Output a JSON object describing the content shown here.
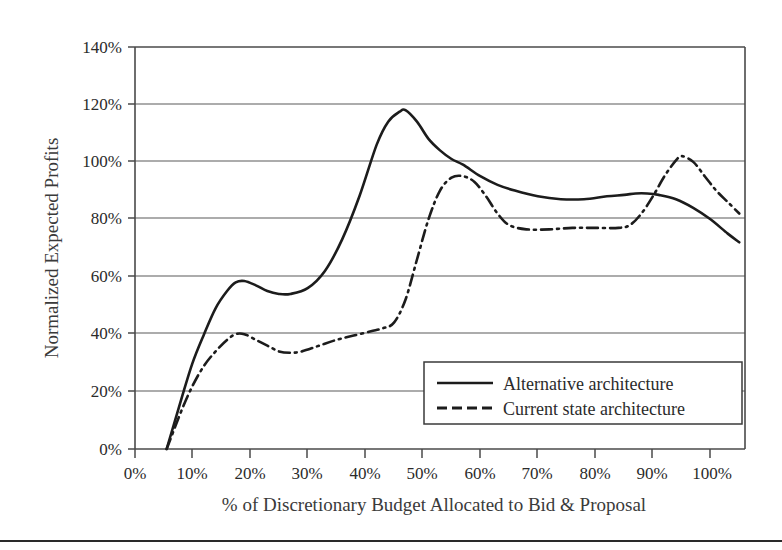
{
  "chart_data": {
    "type": "line",
    "title": "",
    "xlabel": "% of Discretionary Budget Allocated to Bid & Proposal",
    "ylabel": "Normalized Expected Profits",
    "xlim": [
      0,
      106
    ],
    "ylim": [
      0,
      140
    ],
    "x_tick_labels": [
      "0%",
      "10%",
      "20%",
      "30%",
      "40%",
      "50%",
      "60%",
      "70%",
      "80%",
      "90%",
      "100%"
    ],
    "x_tick_values": [
      0,
      10,
      20,
      30,
      40,
      50,
      60,
      70,
      80,
      90,
      100
    ],
    "y_tick_labels": [
      "0%",
      "20%",
      "40%",
      "60%",
      "80%",
      "100%",
      "120%",
      "140%"
    ],
    "y_tick_values": [
      0,
      20,
      40,
      60,
      80,
      100,
      120,
      140
    ],
    "grid": "horizontal",
    "legend_position": "bottom-right",
    "series": [
      {
        "name": "Alternative architecture",
        "style": "solid",
        "color": "#1c1c1c",
        "x": [
          5.5,
          8,
          10,
          12,
          14,
          16,
          17.5,
          19,
          21,
          23,
          25,
          27,
          30,
          33,
          36,
          39,
          42,
          44,
          46,
          47,
          49,
          51,
          53,
          55,
          57,
          60,
          63,
          66,
          70,
          74,
          78,
          82,
          85,
          87,
          89,
          91,
          94,
          97,
          100,
          103,
          105
        ],
        "y": [
          0,
          17,
          30,
          40,
          49,
          55,
          58,
          58.5,
          57,
          55,
          54,
          54,
          56,
          62,
          73,
          88,
          106,
          114,
          117.5,
          118,
          114,
          108,
          104,
          101,
          99,
          95,
          92,
          90,
          88,
          87,
          87,
          88,
          88.5,
          89,
          89,
          88.5,
          87,
          84,
          80,
          75,
          72
        ]
      },
      {
        "name": "Current state architecture",
        "style": "dash-dot",
        "color": "#1c1c1c",
        "x": [
          5.5,
          8,
          10,
          12,
          14,
          16,
          17.5,
          19,
          21,
          23,
          25,
          27,
          29,
          32,
          35,
          38,
          41,
          43,
          45,
          47,
          49,
          51,
          53,
          55,
          57,
          59,
          61,
          63,
          65,
          68,
          72,
          76,
          80,
          84,
          86,
          88,
          90,
          92,
          94,
          95,
          97,
          99,
          101,
          103,
          105
        ],
        "y": [
          0,
          13,
          22,
          29,
          34,
          38,
          40,
          40,
          38,
          36,
          34,
          33.5,
          34,
          36,
          38,
          39.5,
          41,
          42,
          44,
          52,
          66,
          80,
          90,
          94.5,
          95,
          93,
          88,
          82,
          78,
          76.5,
          76.5,
          77,
          77,
          77,
          78,
          82,
          88,
          95,
          100.5,
          102,
          100,
          95,
          90,
          86,
          82
        ]
      }
    ],
    "annotations": []
  },
  "legend": {
    "items": [
      {
        "label": "Alternative architecture",
        "style": "solid"
      },
      {
        "label": "Current state architecture",
        "style": "dashed"
      }
    ]
  },
  "axes": {
    "x_title": "% of Discretionary Budget Allocated to Bid & Proposal",
    "y_title": "Normalized Expected Profits",
    "x_ticks": [
      "0%",
      "10%",
      "20%",
      "30%",
      "40%",
      "50%",
      "60%",
      "70%",
      "80%",
      "90%",
      "100%"
    ],
    "y_ticks": [
      "140%",
      "120%",
      "100%",
      "80%",
      "60%",
      "40%",
      "20%",
      "0%"
    ]
  },
  "colors": {
    "line": "#1c1c1c",
    "grid": "#5a5a5a",
    "frame": "#4a4a4a",
    "text": "#2b2b2b",
    "background": "#ffffff"
  }
}
